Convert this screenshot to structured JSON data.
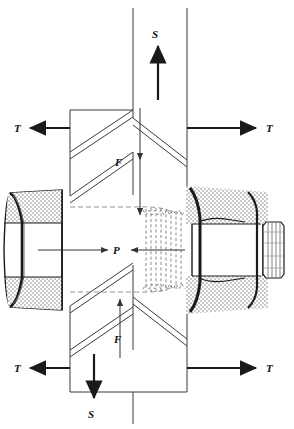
{
  "figure": {
    "kind": "engineering-diagram",
    "width": 294,
    "height": 429,
    "background_color": "#ffffff",
    "line_color": "#1a1a1a",
    "thin_line_color": "#555555",
    "stipple_color": "#c8c8c8",
    "dashed_color": "#777777"
  },
  "labels": {
    "shear_top": "S",
    "shear_bottom": "S",
    "tension_top_left": "T",
    "tension_top_right": "T",
    "tension_bottom_left": "T",
    "tension_bottom_right": "T",
    "friction_top": "F",
    "friction_bottom": "F",
    "preload": "P"
  },
  "components": [
    {
      "name": "bolt-head",
      "side": "left",
      "shape": "hex-head",
      "shaded": true
    },
    {
      "name": "nut",
      "side": "right",
      "shape": "hex-nut",
      "shaded": true
    },
    {
      "name": "bolt-thread-protrusion",
      "side": "right",
      "shape": "threaded-stub"
    },
    {
      "name": "bolt-shank-threads",
      "shape": "hidden-thread-profile",
      "linestyle": "dashed"
    },
    {
      "name": "front-plate",
      "shape": "parallelogram-plate"
    },
    {
      "name": "rear-plate",
      "shape": "parallelogram-plate"
    }
  ],
  "force_arrows": [
    {
      "name": "S-top",
      "label": "S",
      "direction": "up",
      "weight": "thick"
    },
    {
      "name": "S-bottom",
      "label": "S",
      "direction": "down",
      "weight": "thick"
    },
    {
      "name": "T-top-left",
      "label": "T",
      "direction": "left",
      "weight": "thick"
    },
    {
      "name": "T-top-right",
      "label": "T",
      "direction": "right",
      "weight": "thick"
    },
    {
      "name": "T-bottom-left",
      "label": "T",
      "direction": "left",
      "weight": "thick"
    },
    {
      "name": "T-bottom-right",
      "label": "T",
      "direction": "right",
      "weight": "thick"
    },
    {
      "name": "F-top",
      "label": "F",
      "direction": "down",
      "weight": "thin"
    },
    {
      "name": "F-bottom",
      "label": "F",
      "direction": "up",
      "weight": "thin"
    },
    {
      "name": "P-left",
      "label": "P",
      "direction": "right",
      "weight": "thin"
    },
    {
      "name": "P-right",
      "label": "P",
      "direction": "left",
      "weight": "thin"
    }
  ]
}
